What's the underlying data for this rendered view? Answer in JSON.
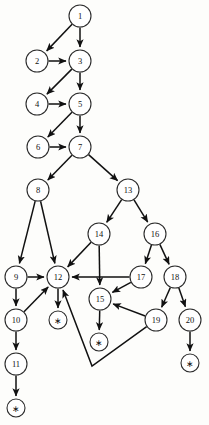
{
  "diagram": {
    "type": "directed-graph",
    "width": 209,
    "height": 425,
    "colors": {
      "background": "#fdfdfb",
      "node_fill": "#ffffff",
      "node_stroke": "#2b2b2b",
      "edge_stroke": "#111111",
      "label": "#111111"
    },
    "node_radius": 11,
    "terminal_radius": 9,
    "nodes": [
      {
        "id": "n1",
        "label": "1",
        "x": 80,
        "y": 16,
        "r": 11,
        "terminal": false
      },
      {
        "id": "n2",
        "label": "2",
        "x": 37,
        "y": 61,
        "r": 11,
        "terminal": false
      },
      {
        "id": "n3",
        "label": "3",
        "x": 80,
        "y": 61,
        "r": 11,
        "terminal": false
      },
      {
        "id": "n4",
        "label": "4",
        "x": 37,
        "y": 104,
        "r": 11,
        "terminal": false
      },
      {
        "id": "n5",
        "label": "5",
        "x": 80,
        "y": 104,
        "r": 11,
        "terminal": false
      },
      {
        "id": "n6",
        "label": "6",
        "x": 38,
        "y": 147,
        "r": 11,
        "terminal": false
      },
      {
        "id": "n7",
        "label": "7",
        "x": 80,
        "y": 147,
        "r": 11,
        "terminal": false
      },
      {
        "id": "n8",
        "label": "8",
        "x": 38,
        "y": 190,
        "r": 11,
        "terminal": false
      },
      {
        "id": "n13",
        "label": "13",
        "x": 128,
        "y": 190,
        "r": 11,
        "terminal": false
      },
      {
        "id": "n14",
        "label": "14",
        "x": 99,
        "y": 234,
        "r": 11,
        "terminal": false
      },
      {
        "id": "n16",
        "label": "16",
        "x": 155,
        "y": 234,
        "r": 11,
        "terminal": false
      },
      {
        "id": "n9",
        "label": "9",
        "x": 16,
        "y": 277,
        "r": 11,
        "terminal": false
      },
      {
        "id": "n12",
        "label": "12",
        "x": 58,
        "y": 277,
        "r": 11,
        "terminal": false
      },
      {
        "id": "n17",
        "label": "17",
        "x": 141,
        "y": 277,
        "r": 11,
        "terminal": false
      },
      {
        "id": "n18",
        "label": "18",
        "x": 175,
        "y": 277,
        "r": 11,
        "terminal": false
      },
      {
        "id": "n15",
        "label": "15",
        "x": 100,
        "y": 299,
        "r": 11,
        "terminal": false
      },
      {
        "id": "n10",
        "label": "10",
        "x": 16,
        "y": 320,
        "r": 11,
        "terminal": false
      },
      {
        "id": "n19",
        "label": "19",
        "x": 156,
        "y": 320,
        "r": 11,
        "terminal": false
      },
      {
        "id": "n20",
        "label": "20",
        "x": 190,
        "y": 320,
        "r": 11,
        "terminal": false
      },
      {
        "id": "n11",
        "label": "11",
        "x": 16,
        "y": 364,
        "r": 11,
        "terminal": false
      },
      {
        "id": "t12",
        "label": "∗",
        "x": 58,
        "y": 320,
        "r": 9,
        "terminal": true
      },
      {
        "id": "t15",
        "label": "∗",
        "x": 99,
        "y": 342,
        "r": 9,
        "terminal": true
      },
      {
        "id": "t20",
        "label": "∗",
        "x": 190,
        "y": 363,
        "r": 9,
        "terminal": true
      },
      {
        "id": "t11",
        "label": "∗",
        "x": 16,
        "y": 408,
        "r": 9,
        "terminal": true
      }
    ],
    "edges": [
      {
        "from": "n1",
        "to": "n2",
        "waypoints": []
      },
      {
        "from": "n1",
        "to": "n3",
        "waypoints": []
      },
      {
        "from": "n2",
        "to": "n3",
        "waypoints": []
      },
      {
        "from": "n3",
        "to": "n4",
        "waypoints": []
      },
      {
        "from": "n3",
        "to": "n5",
        "waypoints": []
      },
      {
        "from": "n4",
        "to": "n5",
        "waypoints": []
      },
      {
        "from": "n5",
        "to": "n6",
        "waypoints": []
      },
      {
        "from": "n5",
        "to": "n7",
        "waypoints": []
      },
      {
        "from": "n6",
        "to": "n7",
        "waypoints": []
      },
      {
        "from": "n7",
        "to": "n8",
        "waypoints": []
      },
      {
        "from": "n7",
        "to": "n13",
        "waypoints": []
      },
      {
        "from": "n8",
        "to": "n9",
        "waypoints": []
      },
      {
        "from": "n8",
        "to": "n12",
        "waypoints": []
      },
      {
        "from": "n13",
        "to": "n14",
        "waypoints": []
      },
      {
        "from": "n13",
        "to": "n16",
        "waypoints": []
      },
      {
        "from": "n14",
        "to": "n12",
        "waypoints": []
      },
      {
        "from": "n14",
        "to": "n15",
        "waypoints": []
      },
      {
        "from": "n16",
        "to": "n17",
        "waypoints": []
      },
      {
        "from": "n16",
        "to": "n18",
        "waypoints": []
      },
      {
        "from": "n17",
        "to": "n12",
        "waypoints": []
      },
      {
        "from": "n17",
        "to": "n15",
        "waypoints": []
      },
      {
        "from": "n18",
        "to": "n19",
        "waypoints": []
      },
      {
        "from": "n18",
        "to": "n20",
        "waypoints": []
      },
      {
        "from": "n19",
        "to": "n15",
        "waypoints": []
      },
      {
        "from": "n19",
        "to": "n12",
        "waypoints": [
          [
            92,
            366
          ]
        ]
      },
      {
        "from": "n9",
        "to": "n12",
        "waypoints": []
      },
      {
        "from": "n9",
        "to": "n10",
        "waypoints": []
      },
      {
        "from": "n10",
        "to": "n12",
        "waypoints": []
      },
      {
        "from": "n10",
        "to": "n11",
        "waypoints": []
      },
      {
        "from": "n11",
        "to": "t11",
        "waypoints": []
      },
      {
        "from": "n12",
        "to": "t12",
        "waypoints": []
      },
      {
        "from": "n15",
        "to": "t15",
        "waypoints": []
      },
      {
        "from": "n20",
        "to": "t20",
        "waypoints": []
      }
    ]
  }
}
